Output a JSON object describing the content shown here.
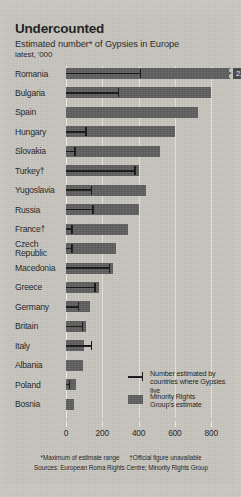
{
  "header": {
    "title": "Undercounted",
    "subtitle": "Estimated number* of Gypsies in Europe",
    "subtitle2": "latest, '000"
  },
  "legend": {
    "official": "Number estimated by\ncountries where Gypsies live",
    "mrg": "Minority Rights\nGroup's estimate"
  },
  "footnotes": {
    "line1_a": "*Maximum of estimate range",
    "line1_b": "†Official figure unavailable",
    "line2": "Sources: European Roma Rights Centre; Minority Rights Group"
  },
  "colors": {
    "bar": "#5d5d5d",
    "whisker": "#141414",
    "background": "#c6c4bd",
    "grid": "#e9e7e1",
    "value_box": "#464646",
    "value_text": "#f0eeea"
  },
  "chart_data": {
    "type": "bar",
    "title": "Undercounted",
    "subtitle": "Estimated number* of Gypsies in Europe",
    "units": "latest, '000",
    "xlabel": "",
    "ylabel": "",
    "xlim": [
      0,
      880
    ],
    "xticks": [
      0,
      200,
      400,
      600,
      800
    ],
    "grid": true,
    "legend_position": "inside-right",
    "orientation": "horizontal",
    "categories": [
      "Romania",
      "Bulgaria",
      "Spain",
      "Hungary",
      "Slovakia",
      "Turkey†",
      "Yugoslavia",
      "Russia",
      "France†",
      "Czech\nRepublic",
      "Macedonia",
      "Greece",
      "Germany",
      "Britain",
      "Italy",
      "Albania",
      "Poland",
      "Bosnia"
    ],
    "series": [
      {
        "name": "Minority Rights Group's estimate",
        "key": "mrg",
        "values": [
          2500,
          800,
          725,
          600,
          520,
          400,
          440,
          400,
          340,
          275,
          260,
          180,
          130,
          110,
          100,
          95,
          55,
          45
        ]
      },
      {
        "name": "Number estimated by countries where Gypsies live",
        "key": "official",
        "values": [
          410,
          290,
          null,
          110,
          50,
          380,
          140,
          150,
          33,
          33,
          240,
          160,
          70,
          90,
          140,
          null,
          20,
          null
        ]
      }
    ],
    "annotations": [
      {
        "category": "Romania",
        "label": "2,500",
        "type": "truncated-bar-value"
      }
    ]
  }
}
